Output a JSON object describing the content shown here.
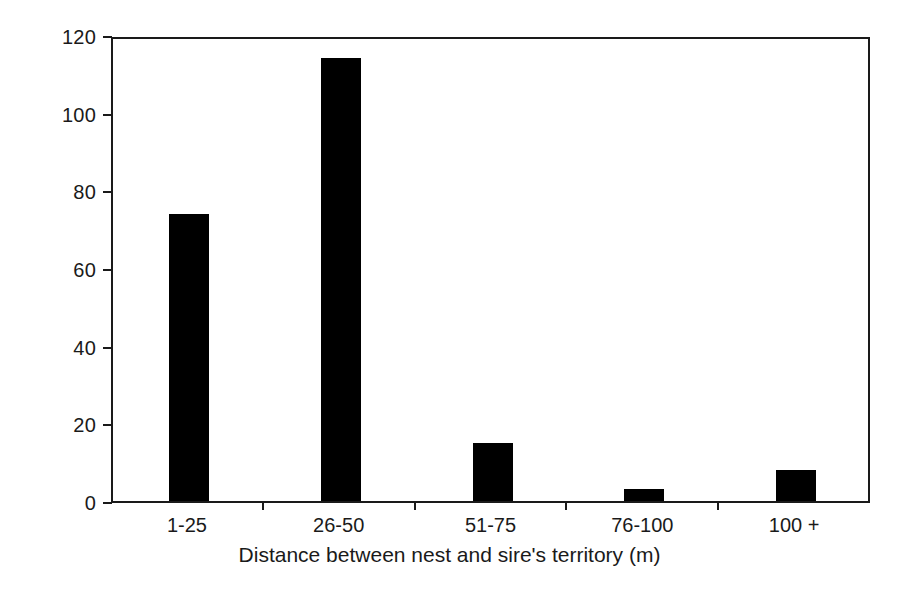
{
  "chart_data": {
    "type": "bar",
    "title": "",
    "subtitle": "",
    "categories": [
      "1-25",
      "26-50",
      "51-75",
      "76-100",
      "100 +"
    ],
    "values": [
      74,
      114,
      15,
      3,
      8
    ],
    "xlabel": "Distance between nest and sire's territory (m)",
    "ylabel": "Frequency",
    "ylim": [
      0,
      120
    ],
    "yticks": [
      0,
      20,
      40,
      60,
      80,
      100,
      120
    ],
    "ytick_labels": [
      "0",
      "20",
      "40",
      "60",
      "80",
      "100",
      "120"
    ],
    "grid": false,
    "legend": false,
    "legend_position": "none",
    "bar_color": "#000000",
    "frame_color": "#1a1a1a",
    "background_color": "#ffffff"
  },
  "axis": {
    "y_title": "Frequency",
    "x_title": "Distance between nest and sire's territory (m)"
  }
}
